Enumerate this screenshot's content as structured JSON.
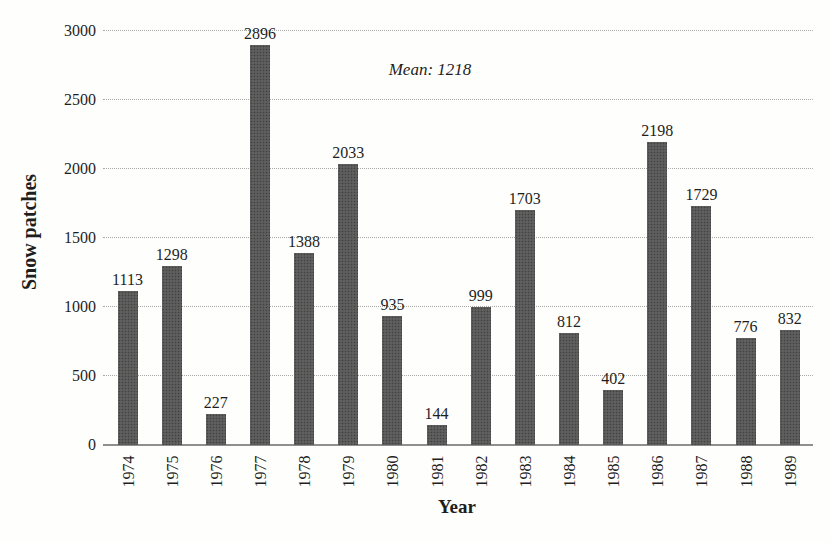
{
  "chart_data": {
    "type": "bar",
    "categories": [
      "1974",
      "1975",
      "1976",
      "1977",
      "1978",
      "1979",
      "1980",
      "1981",
      "1982",
      "1983",
      "1984",
      "1985",
      "1986",
      "1987",
      "1988",
      "1989"
    ],
    "values": [
      1113,
      1298,
      227,
      2896,
      1388,
      2033,
      935,
      144,
      999,
      1703,
      812,
      402,
      2198,
      1729,
      776,
      832
    ],
    "xlabel": "Year",
    "ylabel": "Snow patches",
    "annotation": "Mean: 1218",
    "ylim": [
      0,
      3000
    ],
    "yticks": [
      0,
      500,
      1000,
      1500,
      2000,
      2500,
      3000
    ],
    "grid": "horizontal-dotted",
    "legend": "none",
    "value_labels_shown": true,
    "bar_color": "#585858",
    "gridline_color": "#aaaaaa",
    "text_color": "#1e1e1e"
  }
}
